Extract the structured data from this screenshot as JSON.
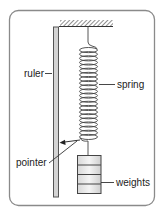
{
  "diagram": {
    "labels": {
      "ruler": "ruler",
      "spring": "spring",
      "pointer": "pointer",
      "weights": "weights"
    },
    "components": [
      "support bracket (hatched)",
      "ruler",
      "spring",
      "pointer",
      "weights"
    ],
    "weights_count": 4,
    "colors": {
      "frame": "#8a8a8a",
      "ruler_fill": "#d4d4d4",
      "line": "#333333",
      "weights_fill": "#e6e6e6"
    }
  }
}
